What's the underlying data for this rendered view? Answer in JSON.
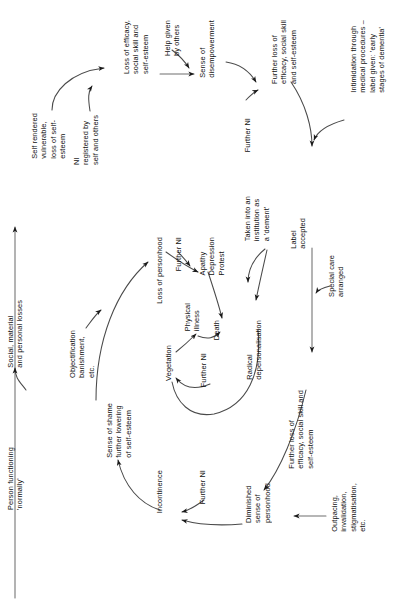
{
  "diagram": {
    "orientation": "text rotated 90 degrees counter-clockwise (read bottom-to-top)",
    "ink_color": "#1a1a1a",
    "background": "#ffffff",
    "nodes": [
      {
        "id": "person-functioning-normally",
        "text": "Person functioning\n'normally'",
        "x": 6,
        "y": 447
      },
      {
        "id": "social-material-personal-losses",
        "text": "Social, material\nand personal losses",
        "x": 6,
        "y": 300
      },
      {
        "id": "self-rendered-vulnerable",
        "text": "Self rendered\nvulnerable,\nloss of self-\nesteem",
        "x": 30,
        "y": 113
      },
      {
        "id": "ni-registered-by-self-and-others",
        "text": "NI\nregistered by\nself and others",
        "x": 72,
        "y": 115
      },
      {
        "id": "loss-of-efficacy-social-skill",
        "text": "Loss of efficacy,\nsocial skill and\nself-esteem",
        "x": 122,
        "y": 20
      },
      {
        "id": "help-given-by-others",
        "text": "Help given\nby others",
        "x": 163,
        "y": 20
      },
      {
        "id": "sense-of-disempowerment",
        "text": "Sense of\ndisempowerment",
        "x": 198,
        "y": 20
      },
      {
        "id": "further-ni-top",
        "text": "Further NI",
        "x": 243,
        "y": 118
      },
      {
        "id": "further-loss-of-efficacy-top",
        "text": "Further loss of\nefficacy, social skill\nand self-esteem",
        "x": 270,
        "y": 20
      },
      {
        "id": "intimidation-medical-procedures",
        "text": "Intimidation through\nmedical procedures –\nlabel given: 'early\nstages of dementia'",
        "x": 349,
        "y": 20
      },
      {
        "id": "label-accepted",
        "text": "Label\naccepted",
        "x": 289,
        "y": 218
      },
      {
        "id": "special-care-arranged",
        "text": "Special care\narranged",
        "x": 327,
        "y": 255
      },
      {
        "id": "taken-into-institution",
        "text": "Taken into an\ninstitution as\na 'dement'",
        "x": 243,
        "y": 196
      },
      {
        "id": "apathy-depression-protest",
        "text": "Apathy\nDepression\nProtest",
        "x": 198,
        "y": 237
      },
      {
        "id": "further-ni-apathy",
        "text": "Further NI",
        "x": 174,
        "y": 237
      },
      {
        "id": "loss-of-personhood",
        "text": "Loss of personhood",
        "x": 155,
        "y": 237
      },
      {
        "id": "physical-illness",
        "text": "Physical\nillness",
        "x": 183,
        "y": 303
      },
      {
        "id": "death",
        "text": "Death",
        "x": 212,
        "y": 320
      },
      {
        "id": "vegetation",
        "text": "Vegetation",
        "x": 164,
        "y": 345
      },
      {
        "id": "further-ni-vegetation",
        "text": "Further NI",
        "x": 199,
        "y": 353
      },
      {
        "id": "radical-depersonalisation",
        "text": "Radical\ndepersonalisation",
        "x": 245,
        "y": 320
      },
      {
        "id": "further-loss-of-efficacy-bottom",
        "text": "Further loss of\nefficacy, social skill and\nself-esteem",
        "x": 287,
        "y": 390
      },
      {
        "id": "outpacing-invalidation",
        "text": "Outpacing,\ninvalidation,\nstigmatisation,\netc.",
        "x": 330,
        "y": 483
      },
      {
        "id": "diminished-sense-of-personhood",
        "text": "Diminished\nsense of\npersonhood",
        "x": 244,
        "y": 483
      },
      {
        "id": "further-ni-incontinence",
        "text": "Further NI",
        "x": 198,
        "y": 470
      },
      {
        "id": "incontinence",
        "text": "Incontinence",
        "x": 155,
        "y": 470
      },
      {
        "id": "sense-of-shame",
        "text": "Sense of shame\nfurther lowering\nof self-esteem",
        "x": 105,
        "y": 403
      },
      {
        "id": "objectification-banishment",
        "text": "Objectification\nbanishment,\netc.",
        "x": 68,
        "y": 330
      }
    ],
    "edges": [
      {
        "id": "edge-person-to-self-rendered",
        "from": "person-functioning-normally",
        "to": "self-rendered-vulnerable",
        "kind": "straight-vertical"
      },
      {
        "id": "edge-losses-into-spine",
        "from": "social-material-personal-losses",
        "to": "edge-person-to-self-rendered",
        "kind": "short-hook"
      },
      {
        "id": "edge-self-rendered-to-loss",
        "from": "self-rendered-vulnerable",
        "to": "loss-of-efficacy-social-skill",
        "kind": "curve"
      },
      {
        "id": "edge-ni-registered-into-curve",
        "from": "ni-registered-by-self-and-others",
        "to": "edge-self-rendered-to-loss",
        "kind": "hook"
      },
      {
        "id": "edge-loss-to-disempowerment",
        "from": "loss-of-efficacy-social-skill",
        "to": "sense-of-disempowerment",
        "kind": "straight-horizontal"
      },
      {
        "id": "edge-help-given-into-line",
        "from": "help-given-by-others",
        "to": "edge-loss-to-disempowerment",
        "kind": "hook"
      },
      {
        "id": "edge-disempowerment-to-further",
        "from": "sense-of-disempowerment",
        "to": "further-loss-of-efficacy-top",
        "kind": "curve"
      },
      {
        "id": "edge-further-ni-into-curve",
        "from": "further-ni-top",
        "to": "edge-disempowerment-to-further",
        "kind": "hook"
      },
      {
        "id": "edge-further-loss-to-label",
        "from": "further-loss-of-efficacy-top",
        "to": "label-accepted",
        "kind": "curve"
      },
      {
        "id": "edge-intimidation-to-label",
        "from": "intimidation-medical-procedures",
        "to": "label-accepted",
        "kind": "curve"
      },
      {
        "id": "edge-label-to-further-loss-bottom",
        "from": "label-accepted",
        "to": "further-loss-of-efficacy-bottom",
        "kind": "straight-vertical"
      },
      {
        "id": "edge-special-care-into-line",
        "from": "special-care-arranged",
        "to": "edge-label-to-further-loss-bottom",
        "kind": "hook"
      },
      {
        "id": "edge-taken-into-institution",
        "from": "taken-into-institution",
        "to": "apathy-depression-protest",
        "kind": "curve"
      },
      {
        "id": "edge-institution-to-radical",
        "from": "taken-into-institution",
        "to": "radical-depersonalisation",
        "kind": "curve"
      },
      {
        "id": "edge-loss-personhood-to-apathy",
        "from": "loss-of-personhood",
        "to": "apathy-depression-protest",
        "kind": "curve"
      },
      {
        "id": "edge-further-ni-to-apathy",
        "from": "further-ni-apathy",
        "to": "edge-loss-personhood-to-apathy",
        "kind": "hook"
      },
      {
        "id": "edge-apathy-to-death",
        "from": "apathy-depression-protest",
        "to": "death",
        "kind": "curve"
      },
      {
        "id": "edge-vegetation-to-physical",
        "from": "vegetation",
        "to": "physical-illness",
        "kind": "curve"
      },
      {
        "id": "edge-physical-to-death",
        "from": "physical-illness",
        "to": "death",
        "kind": "curve"
      },
      {
        "id": "edge-further-ni-to-vegetation",
        "from": "further-ni-vegetation",
        "to": "vegetation",
        "kind": "curve"
      },
      {
        "id": "edge-radical-to-vegetation-loop",
        "from": "radical-depersonalisation",
        "to": "vegetation",
        "kind": "long-curve"
      },
      {
        "id": "edge-further-loss-bottom-to-diminished",
        "from": "further-loss-of-efficacy-bottom",
        "to": "diminished-sense-of-personhood",
        "kind": "curve"
      },
      {
        "id": "edge-outpacing-to-diminished",
        "from": "outpacing-invalidation",
        "to": "diminished-sense-of-personhood",
        "kind": "straight-horizontal"
      },
      {
        "id": "edge-diminished-to-incontinence",
        "from": "diminished-sense-of-personhood",
        "to": "incontinence",
        "kind": "curve"
      },
      {
        "id": "edge-further-ni-to-incontinence",
        "from": "further-ni-incontinence",
        "to": "incontinence",
        "kind": "curve"
      },
      {
        "id": "edge-incontinence-to-shame",
        "from": "incontinence",
        "to": "sense-of-shame",
        "kind": "curve"
      },
      {
        "id": "edge-shame-to-loss-personhood",
        "from": "sense-of-shame",
        "to": "loss-of-personhood",
        "kind": "curve"
      },
      {
        "id": "edge-objectification-into-curve",
        "from": "objectification-banishment",
        "to": "edge-shame-to-loss-personhood",
        "kind": "hook"
      }
    ]
  }
}
